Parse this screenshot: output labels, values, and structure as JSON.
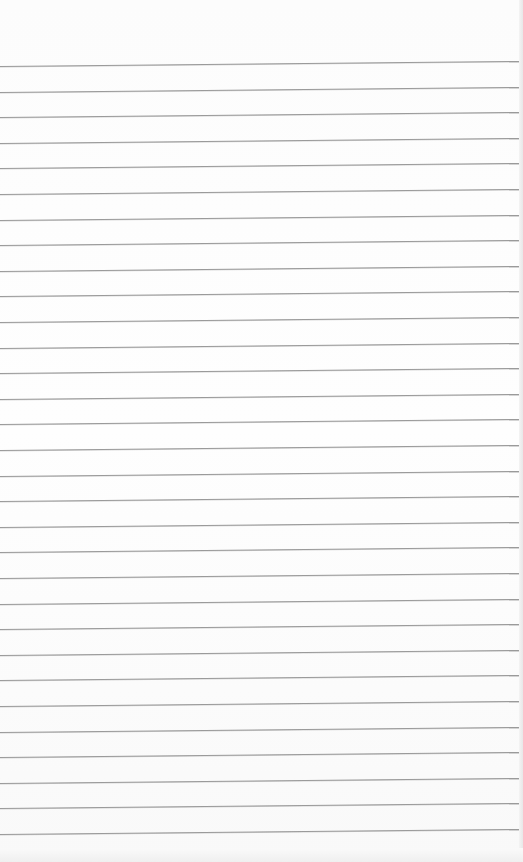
{
  "page": {
    "type": "lined-paper",
    "background_color": "#fdfdfd",
    "line_color": "#9a9a9a",
    "line_count": 31,
    "first_line_y": 66,
    "line_spacing": 25.6
  }
}
